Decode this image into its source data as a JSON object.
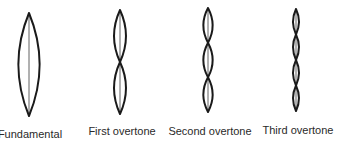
{
  "diagram": {
    "modes": [
      {
        "label": "Fundamental",
        "loops": 1,
        "cx": 29,
        "top": 13,
        "bottom": 116,
        "halfwidth": 16,
        "label_x": 30,
        "label_y": 129
      },
      {
        "label": "First overtone",
        "loops": 2,
        "cx": 120,
        "top": 10,
        "bottom": 114,
        "halfwidth": 9,
        "label_x": 122,
        "label_y": 126
      },
      {
        "label": "Second overtone",
        "loops": 3,
        "cx": 208,
        "top": 8,
        "bottom": 112,
        "halfwidth": 7,
        "label_x": 210,
        "label_y": 126
      },
      {
        "label": "Third overtone",
        "loops": 4,
        "cx": 296,
        "top": 9,
        "bottom": 111,
        "halfwidth": 4.5,
        "label_x": 298,
        "label_y": 125
      }
    ],
    "colors": {
      "stroke": "#1a1a1a",
      "text": "#2a2a2a",
      "background": "#ffffff"
    }
  }
}
